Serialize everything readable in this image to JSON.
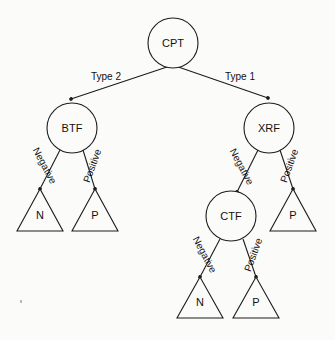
{
  "diagram": {
    "type": "decision-tree",
    "background_color": "#fbfbfa",
    "stroke_color": "#1d1d1d",
    "nodes": {
      "root": {
        "label": "CPT",
        "cx": 173,
        "cy": 43,
        "r": 25
      },
      "left": {
        "label": "BTF",
        "cx": 72,
        "cy": 128,
        "r": 25
      },
      "right": {
        "label": "XRF",
        "cx": 269,
        "cy": 128,
        "r": 25
      },
      "right_left": {
        "label": "CTF",
        "cx": 231,
        "cy": 216,
        "r": 25
      }
    },
    "leaves": {
      "btf_negative": {
        "label": "N",
        "apex_x": 40,
        "apex_y": 189,
        "half_width": 23,
        "height": 42
      },
      "btf_positive": {
        "label": "P",
        "apex_x": 95,
        "apex_y": 189,
        "half_width": 23,
        "height": 42
      },
      "xrf_positive": {
        "label": "P",
        "apex_x": 293,
        "apex_y": 189,
        "half_width": 23,
        "height": 42
      },
      "ctf_negative": {
        "label": "N",
        "apex_x": 200,
        "apex_y": 277,
        "half_width": 23,
        "height": 41
      },
      "ctf_positive": {
        "label": "P",
        "apex_x": 256,
        "apex_y": 277,
        "half_width": 23,
        "height": 41
      }
    },
    "edges": [
      {
        "id": "cpt-to-btf",
        "label": "Type 2",
        "from": "CPT",
        "to": "BTF",
        "x1": 185,
        "y1": 61,
        "x2": 71,
        "y2": 99,
        "label_x": 106,
        "label_y": 77,
        "label_rotation": 0
      },
      {
        "id": "cpt-to-xrf",
        "label": "Type 1",
        "from": "CPT",
        "to": "XRF",
        "x1": 161,
        "y1": 61,
        "x2": 268,
        "y2": 98,
        "label_x": 240,
        "label_y": 77,
        "label_rotation": 0
      },
      {
        "id": "btf-to-n",
        "label": "Negative",
        "from": "BTF",
        "to": "N",
        "x1": 60,
        "y1": 150,
        "x2": 40,
        "y2": 189,
        "label_x": 44,
        "label_y": 166,
        "label_rotation": 62
      },
      {
        "id": "btf-to-p",
        "label": "Positive",
        "from": "BTF",
        "to": "P",
        "x1": 83,
        "y1": 150,
        "x2": 95,
        "y2": 189,
        "label_x": 93,
        "label_y": 166,
        "label_rotation": -70
      },
      {
        "id": "xrf-to-ctf",
        "label": "Negative",
        "from": "XRF",
        "to": "CTF",
        "x1": 258,
        "y1": 150,
        "x2": 237,
        "y2": 192,
        "label_x": 241,
        "label_y": 167,
        "label_rotation": 62
      },
      {
        "id": "xrf-to-p",
        "label": "Positive",
        "from": "XRF",
        "to": "P",
        "x1": 280,
        "y1": 150,
        "x2": 293,
        "y2": 189,
        "label_x": 290,
        "label_y": 166,
        "label_rotation": -70
      },
      {
        "id": "ctf-to-n",
        "label": "Negative",
        "from": "CTF",
        "to": "N",
        "x1": 220,
        "y1": 239,
        "x2": 200,
        "y2": 277,
        "label_x": 204,
        "label_y": 255,
        "label_rotation": 62
      },
      {
        "id": "ctf-to-p",
        "label": "Positive",
        "from": "CTF",
        "to": "P",
        "x1": 243,
        "y1": 239,
        "x2": 256,
        "y2": 277,
        "label_x": 254,
        "label_y": 255,
        "label_rotation": -70
      }
    ]
  }
}
